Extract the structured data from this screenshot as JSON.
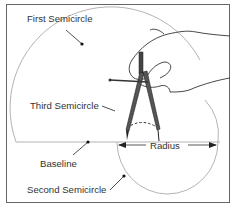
{
  "diagram": {
    "type": "geometric-construction",
    "labels": {
      "first_semicircle": "First Semicircle",
      "third_semicircle": "Third Semicircle",
      "baseline": "Baseline",
      "second_semicircle": "Second Semicircle",
      "radius": "Radius"
    },
    "colors": {
      "stroke": "#999999",
      "frame": "#555555",
      "text": "#333333",
      "pointer": "#222222",
      "compass": "#333333"
    }
  }
}
